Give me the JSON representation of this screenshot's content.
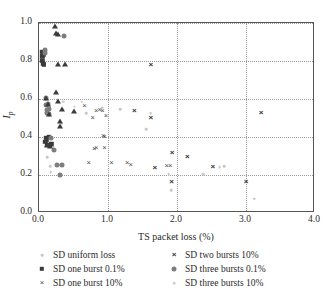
{
  "chart_data": {
    "type": "scatter",
    "title": "",
    "xlabel": "TS packet loss (%)",
    "ylabel": "Ip",
    "ylabel_base": "I",
    "ylabel_sub": "p",
    "xlim": [
      0.0,
      4.0
    ],
    "ylim": [
      0.0,
      1.0
    ],
    "xticks": [
      "0.0",
      "1.0",
      "2.0",
      "3.0",
      "4.0"
    ],
    "xtick_values": [
      0.0,
      1.0,
      2.0,
      3.0,
      4.0
    ],
    "yticks": [
      "0.0",
      "0.2",
      "0.4",
      "0.6",
      "0.8",
      "1.0"
    ],
    "ytick_values": [
      0.0,
      0.2,
      0.4,
      0.6,
      0.8,
      1.0
    ],
    "grid": "dotted both axes at major ticks",
    "legend_position": "below plot, two columns",
    "series": [
      {
        "name": "SD uniform loss",
        "marker": "small-faint-dot",
        "color": "#c8c8c8",
        "points": [
          [
            0.12,
            0.295
          ],
          [
            0.16,
            0.245
          ],
          [
            0.17,
            0.215
          ],
          [
            0.3,
            0.255
          ],
          [
            0.33,
            0.47
          ],
          [
            0.35,
            0.585
          ],
          [
            0.62,
            0.585
          ],
          [
            0.68,
            0.525
          ],
          [
            0.92,
            0.555
          ],
          [
            0.95,
            0.405
          ],
          [
            1.55,
            0.44
          ],
          [
            1.62,
            0.525
          ],
          [
            1.88,
            0.205
          ],
          [
            1.92,
            0.12
          ],
          [
            2.38,
            0.205
          ],
          [
            2.62,
            0.24
          ],
          [
            2.68,
            0.245
          ],
          [
            3.12,
            0.075
          ],
          [
            0.52,
            0.56
          ],
          [
            1.18,
            0.545
          ]
        ]
      },
      {
        "name": "SD one burst 0.1%",
        "marker": "filled-square",
        "color": "#3b3b3b",
        "points": [
          [
            0.05,
            0.85
          ],
          [
            0.06,
            0.835
          ],
          [
            0.05,
            0.8
          ],
          [
            0.06,
            0.785
          ],
          [
            0.07,
            0.78
          ],
          [
            0.05,
            0.825
          ],
          [
            0.1,
            0.395
          ],
          [
            0.11,
            0.385
          ],
          [
            0.12,
            0.36
          ],
          [
            0.14,
            0.4
          ],
          [
            0.16,
            0.355
          ],
          [
            0.18,
            0.365
          ],
          [
            0.09,
            0.375
          ]
        ]
      },
      {
        "name": "SD one burst 10%",
        "marker": "x-thin",
        "color": "#4a4a4a",
        "points": [
          [
            0.66,
            0.565
          ],
          [
            0.78,
            0.5
          ],
          [
            0.83,
            0.535
          ],
          [
            0.88,
            0.54
          ],
          [
            0.92,
            0.535
          ],
          [
            0.97,
            0.512
          ],
          [
            0.93,
            0.405
          ],
          [
            0.95,
            0.4
          ],
          [
            0.8,
            0.335
          ],
          [
            0.83,
            0.34
          ],
          [
            0.95,
            0.34
          ],
          [
            0.72,
            0.265
          ],
          [
            1.05,
            0.265
          ],
          [
            1.28,
            0.262
          ],
          [
            1.33,
            0.255
          ],
          [
            1.85,
            0.25
          ],
          [
            1.9,
            0.248
          ]
        ]
      },
      {
        "name": "SD two bursts 10%",
        "marker": "x-bold",
        "color": "#2f2f2f",
        "points": [
          [
            1.62,
            0.78
          ],
          [
            3.22,
            0.528
          ],
          [
            1.38,
            0.537
          ],
          [
            1.62,
            0.498
          ],
          [
            1.93,
            0.315
          ],
          [
            2.15,
            0.297
          ],
          [
            1.68,
            0.238
          ],
          [
            2.52,
            0.24
          ],
          [
            1.92,
            0.165
          ],
          [
            3.0,
            0.163
          ]
        ]
      },
      {
        "name": "SD three bursts 0.1%",
        "marker": "filled-circle",
        "color": "#7d7d7d",
        "points": [
          [
            0.36,
            0.932
          ],
          [
            0.08,
            0.858
          ],
          [
            0.08,
            0.84
          ],
          [
            0.1,
            0.605
          ],
          [
            0.1,
            0.57
          ],
          [
            0.11,
            0.54
          ],
          [
            0.12,
            0.525
          ],
          [
            0.13,
            0.575
          ],
          [
            0.14,
            0.55
          ],
          [
            0.15,
            0.52
          ],
          [
            0.18,
            0.395
          ],
          [
            0.22,
            0.33
          ],
          [
            0.26,
            0.255
          ],
          [
            0.33,
            0.253
          ],
          [
            0.3,
            0.198
          ]
        ]
      },
      {
        "name": "SD three bursts 10%",
        "marker": "small-faint-dot",
        "color": "#d2d2d2",
        "points": [
          [
            0.23,
            0.985
          ],
          [
            0.25,
            0.948
          ],
          [
            0.27,
            0.943
          ],
          [
            0.34,
            0.545
          ],
          [
            0.5,
            0.535
          ],
          [
            0.27,
            0.785
          ],
          [
            0.38,
            0.782
          ],
          [
            0.25,
            0.635
          ],
          [
            0.27,
            0.59
          ],
          [
            0.3,
            0.485
          ],
          [
            0.31,
            0.458
          ]
        ]
      }
    ],
    "legend": [
      {
        "label": "SD uniform loss",
        "marker": "small-faint-dot",
        "column": 0,
        "row": 0
      },
      {
        "label": "SD one burst 0.1%",
        "marker": "filled-square",
        "column": 0,
        "row": 1
      },
      {
        "label": "SD one burst 10%",
        "marker": "x-thin",
        "column": 0,
        "row": 2
      },
      {
        "label": "SD two bursts 10%",
        "marker": "x-bold",
        "column": 1,
        "row": 0
      },
      {
        "label": "SD three bursts 0.1%",
        "marker": "filled-circle",
        "column": 1,
        "row": 1
      },
      {
        "label": "SD three bursts 10%",
        "marker": "small-faint-dot",
        "column": 1,
        "row": 2
      }
    ]
  }
}
